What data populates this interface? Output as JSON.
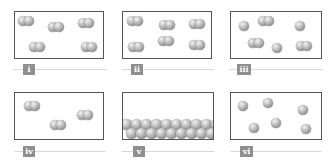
{
  "figure": {
    "colors": {
      "sphere": "#a0a0a0",
      "box_border": "#555555",
      "label_bg": "#8f8f8f",
      "label_text": "#ffffff",
      "rule": "#d8d8d8"
    },
    "panels": [
      {
        "label": "i",
        "content": "5 diatomic molecules"
      },
      {
        "label": "ii",
        "content": "6 diatomic molecules"
      },
      {
        "label": "iii",
        "content": "3 single atoms and 3 diatomic molecules"
      },
      {
        "label": "iv",
        "content": "3 diatomic molecules"
      },
      {
        "label": "v",
        "content": "closely packed atoms at bottom (solid)"
      },
      {
        "label": "vi",
        "content": "6 single atoms"
      }
    ]
  }
}
